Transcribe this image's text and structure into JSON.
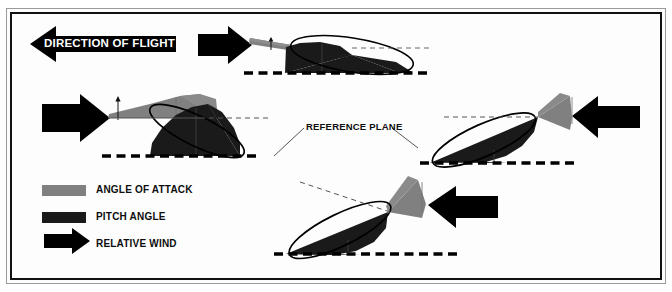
{
  "figure": {
    "background_color": "#fdfdfd",
    "frame_color": "#111111",
    "outer_frame_color": "#9a9a9a"
  },
  "colors": {
    "angle_of_attack": "#808080",
    "pitch_angle": "#1a1a1a",
    "relative_wind": "#000000",
    "reference_plane": "#000000",
    "airfoil_outline": "#000000",
    "leader_line": "#555555"
  },
  "banner": {
    "label": "DIRECTION OF FLIGHT",
    "arrow_direction": "left",
    "arrow_color": "#000000",
    "text_color": "#ffffff"
  },
  "annotations": {
    "reference_plane_label": "REFERENCE PLANE"
  },
  "legend": {
    "items": [
      {
        "label": "ANGLE OF ATTACK",
        "swatch": "#808080",
        "swatch_type": "bar"
      },
      {
        "label": "PITCH ANGLE",
        "swatch": "#1a1a1a",
        "swatch_type": "bar"
      },
      {
        "label": "RELATIVE WIND",
        "swatch": "#000000",
        "swatch_type": "arrow-right"
      }
    ]
  },
  "diagrams": [
    {
      "name": "top-right-low-angle",
      "position": "top-right",
      "wind_arrow_direction": "right",
      "angle_of_attack": "small",
      "pitch_angle": "moderate",
      "has_reference_plane": true,
      "has_angle_tick": true
    },
    {
      "name": "middle-left-high-angle",
      "position": "middle-left",
      "wind_arrow_direction": "right",
      "angle_of_attack": "large",
      "pitch_angle": "large",
      "has_reference_plane": true,
      "has_angle_tick": true
    },
    {
      "name": "middle-right-climb",
      "position": "middle-right",
      "wind_arrow_direction": "left",
      "angle_of_attack": "moderate",
      "pitch_angle": "large",
      "has_reference_plane": true,
      "has_angle_tick": false
    },
    {
      "name": "bottom-center-descent",
      "position": "bottom-center",
      "wind_arrow_direction": "left",
      "angle_of_attack": "large",
      "pitch_angle": "large",
      "has_reference_plane": true,
      "has_angle_tick": false
    }
  ]
}
